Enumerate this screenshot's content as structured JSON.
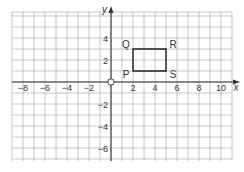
{
  "diagram": {
    "type": "coordinate-grid",
    "axes": {
      "x_label": "x",
      "y_label": "y",
      "origin_label": "O",
      "x_ticks": [
        {
          "value": -8,
          "label": "−8"
        },
        {
          "value": -6,
          "label": "−6"
        },
        {
          "value": -4,
          "label": "−4"
        },
        {
          "value": -2,
          "label": "−2"
        },
        {
          "value": 2,
          "label": "2"
        },
        {
          "value": 4,
          "label": "4"
        },
        {
          "value": 6,
          "label": "6"
        },
        {
          "value": 8,
          "label": "8"
        },
        {
          "value": 10,
          "label": "10"
        }
      ],
      "y_ticks": [
        {
          "value": 4,
          "label": "4"
        },
        {
          "value": 2,
          "label": "2"
        },
        {
          "value": -2,
          "label": "−2"
        },
        {
          "value": -4,
          "label": "−4"
        },
        {
          "value": -6,
          "label": "−6"
        }
      ],
      "x_range": [
        -9,
        11
      ],
      "y_range": [
        -7,
        6
      ]
    },
    "shape": {
      "name": "rectangle PQRS",
      "vertices": [
        {
          "label": "P",
          "x": 2,
          "y": 1
        },
        {
          "label": "Q",
          "x": 2,
          "y": 3
        },
        {
          "label": "R",
          "x": 5,
          "y": 3
        },
        {
          "label": "S",
          "x": 5,
          "y": 1
        }
      ]
    },
    "colors": {
      "grid": "#b8b8b8",
      "axis": "#333333",
      "shape": "#222222",
      "text": "#333333"
    }
  }
}
